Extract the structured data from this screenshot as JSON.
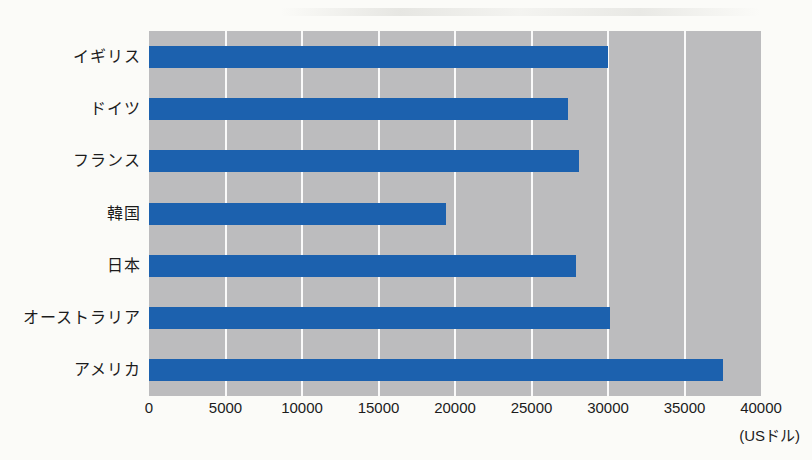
{
  "chart_data": {
    "type": "bar",
    "orientation": "horizontal",
    "title": "",
    "categories": [
      "イギリス",
      "ドイツ",
      "フランス",
      "韓国",
      "日本",
      "オーストラリア",
      "アメリカ"
    ],
    "values": [
      30000,
      27400,
      28100,
      19400,
      27900,
      30100,
      37500
    ],
    "xlabel": "(USドル)",
    "ylabel": "",
    "xlim": [
      0,
      40000
    ],
    "xticks": [
      0,
      5000,
      10000,
      15000,
      20000,
      25000,
      30000,
      35000,
      40000
    ],
    "grid": "vertical white gridlines on gray plot background",
    "legend": "none",
    "bar_color": "#1c61ae",
    "plot_background": "#bcbcbe",
    "page_background": "#fbfbf8",
    "text_color": "#1c1c1c"
  }
}
